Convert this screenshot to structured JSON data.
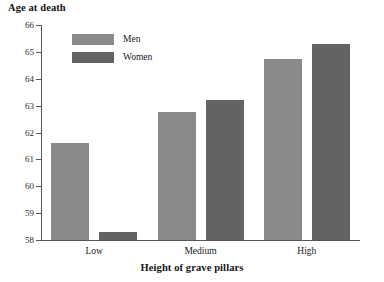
{
  "chart_data": {
    "type": "bar",
    "title": "",
    "xlabel": "Height of grave pillars",
    "ylabel": "Age at death",
    "categories": [
      "Low",
      "Medium",
      "High"
    ],
    "series": [
      {
        "name": "Men",
        "color": "#8a8a8a",
        "values": [
          61.6,
          62.75,
          64.75
        ]
      },
      {
        "name": "Women",
        "color": "#636363",
        "values": [
          58.3,
          63.2,
          65.3
        ]
      }
    ],
    "ylim": [
      58,
      66
    ],
    "yticks": [
      58,
      59,
      60,
      61,
      62,
      63,
      64,
      65,
      66
    ],
    "ytick_labels": [
      "58",
      "59",
      "60",
      "61",
      "62",
      "63",
      "64",
      "65",
      "66"
    ],
    "grid": false,
    "legend_position": "top-left-inside"
  },
  "legend": {
    "entries": [
      {
        "label": "Men"
      },
      {
        "label": "Women"
      }
    ]
  },
  "axes": {
    "y_title": "Age at death",
    "x_title": "Height of grave pillars"
  }
}
